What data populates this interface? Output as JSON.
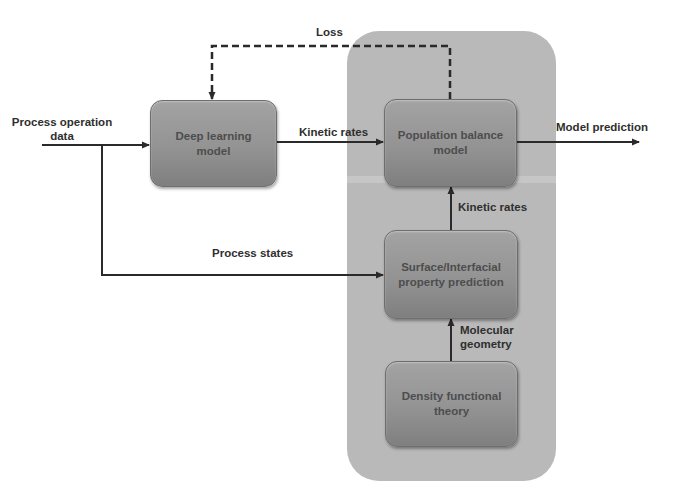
{
  "diagram": {
    "boxes": {
      "deep_learning": "Deep learning model",
      "population_balance": "Population balance model",
      "surface_property": "Surface/Interfacial property prediction",
      "dft": "Density functional theory"
    },
    "edges": {
      "input_label_line1": "Process operation",
      "input_label_line2": "data",
      "loss": "Loss",
      "kinetic_rates_dl_to_pb": "Kinetic rates",
      "model_prediction": "Model prediction",
      "kinetic_rates_sp_to_pb": "Kinetic rates",
      "process_states": "Process states",
      "molecular_geometry_line1": "Molecular",
      "molecular_geometry_line2": "geometry"
    },
    "colors": {
      "panel": "#b9b9b9",
      "box": "#939393",
      "line": "#2a2a2a",
      "text": "#2f2f2f"
    }
  }
}
